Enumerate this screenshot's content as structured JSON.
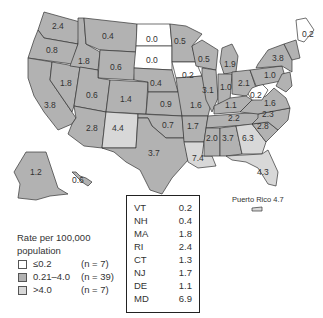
{
  "colors": {
    "low": "#ffffff",
    "mid": "#b2b2b2",
    "high": "#d8d8d8",
    "border": "#333333"
  },
  "map": {
    "states": [
      {
        "abbr": "WA",
        "value": "2.4",
        "category": "mid"
      },
      {
        "abbr": "OR",
        "value": "0.8",
        "category": "mid"
      },
      {
        "abbr": "CA",
        "value": "3.8",
        "category": "mid"
      },
      {
        "abbr": "NV",
        "value": "1.8",
        "category": "mid"
      },
      {
        "abbr": "ID",
        "value": "1.8",
        "category": "mid"
      },
      {
        "abbr": "MT",
        "value": "0.4",
        "category": "mid"
      },
      {
        "abbr": "WY",
        "value": "0.6",
        "category": "mid"
      },
      {
        "abbr": "UT",
        "value": "0.6",
        "category": "mid"
      },
      {
        "abbr": "AZ",
        "value": "2.8",
        "category": "mid"
      },
      {
        "abbr": "CO",
        "value": "1.4",
        "category": "mid"
      },
      {
        "abbr": "NM",
        "value": "4.4",
        "category": "high"
      },
      {
        "abbr": "ND",
        "value": "0.0",
        "category": "low"
      },
      {
        "abbr": "SD",
        "value": "0.0",
        "category": "low"
      },
      {
        "abbr": "NE",
        "value": "0.4",
        "category": "mid"
      },
      {
        "abbr": "KS",
        "value": "0.9",
        "category": "mid"
      },
      {
        "abbr": "OK",
        "value": "0.7",
        "category": "mid"
      },
      {
        "abbr": "TX",
        "value": "3.7",
        "category": "mid"
      },
      {
        "abbr": "MN",
        "value": "0.5",
        "category": "mid"
      },
      {
        "abbr": "IA",
        "value": "0.2",
        "category": "low"
      },
      {
        "abbr": "MO",
        "value": "1.6",
        "category": "mid"
      },
      {
        "abbr": "AR",
        "value": "1.7",
        "category": "mid"
      },
      {
        "abbr": "LA",
        "value": "7.4",
        "category": "high"
      },
      {
        "abbr": "WI",
        "value": "0.5",
        "category": "mid"
      },
      {
        "abbr": "IL",
        "value": "3.1",
        "category": "mid"
      },
      {
        "abbr": "MI",
        "value": "1.9",
        "category": "mid"
      },
      {
        "abbr": "IN",
        "value": "1.0",
        "category": "mid"
      },
      {
        "abbr": "OH",
        "value": "2.1",
        "category": "mid"
      },
      {
        "abbr": "KY",
        "value": "1.1",
        "category": "mid"
      },
      {
        "abbr": "TN",
        "value": "2.2",
        "category": "mid"
      },
      {
        "abbr": "MS",
        "value": "2.0",
        "category": "mid"
      },
      {
        "abbr": "AL",
        "value": "3.7",
        "category": "mid"
      },
      {
        "abbr": "GA",
        "value": "6.3",
        "category": "high"
      },
      {
        "abbr": "FL",
        "value": "4.3",
        "category": "high"
      },
      {
        "abbr": "SC",
        "value": "2.8",
        "category": "mid"
      },
      {
        "abbr": "NC",
        "value": "2.3",
        "category": "mid"
      },
      {
        "abbr": "VA",
        "value": "1.6",
        "category": "mid"
      },
      {
        "abbr": "WV",
        "value": "0.2",
        "category": "low"
      },
      {
        "abbr": "PA",
        "value": "1.0",
        "category": "mid"
      },
      {
        "abbr": "NY",
        "value": "3.8",
        "category": "mid"
      },
      {
        "abbr": "ME",
        "value": "0.2",
        "category": "low"
      },
      {
        "abbr": "AK",
        "value": "1.2",
        "category": "mid"
      },
      {
        "abbr": "HI",
        "value": "0.6",
        "category": "mid"
      }
    ],
    "puerto_rico": {
      "label": "Puerto Rico 4.7",
      "value": "4.7",
      "category": "high"
    }
  },
  "small_states_table": [
    {
      "state": "VT",
      "value": "0.2"
    },
    {
      "state": "NH",
      "value": "0.4"
    },
    {
      "state": "MA",
      "value": "1.8"
    },
    {
      "state": "RI",
      "value": "2.4"
    },
    {
      "state": "CT",
      "value": "1.3"
    },
    {
      "state": "NJ",
      "value": "1.7"
    },
    {
      "state": "DE",
      "value": "1.1"
    },
    {
      "state": "MD",
      "value": "6.9"
    }
  ],
  "legend": {
    "title_line1": "Rate per 100,000",
    "title_line2": "population",
    "items": [
      {
        "range": "≤0.2",
        "count": "(n = 7)",
        "category": "low"
      },
      {
        "range": "0.21–4.0",
        "count": "(n = 39)",
        "category": "mid"
      },
      {
        "range": ">4.0",
        "count": "(n = 7)",
        "category": "high"
      }
    ]
  }
}
